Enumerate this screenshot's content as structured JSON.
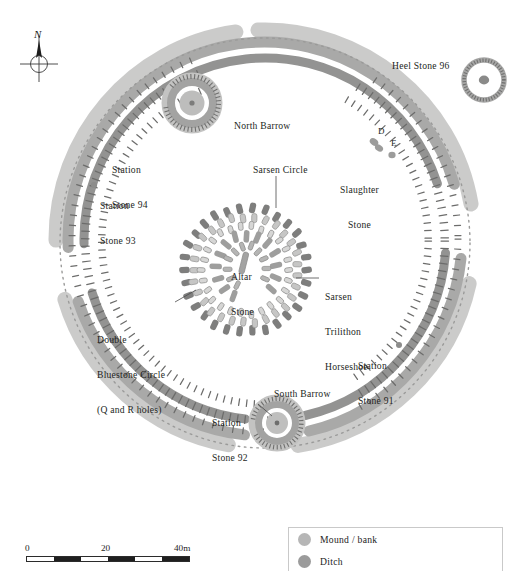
{
  "figure": {
    "kind": "archaeological-site-plan"
  },
  "compass": {
    "letter": "N",
    "icon": "north-arrow-icon"
  },
  "labels": [
    {
      "id": "north-barrow",
      "text": "North Barrow",
      "x": 234,
      "y": 120,
      "align": "left",
      "lines": [
        "North Barrow"
      ]
    },
    {
      "id": "heel-stone-96",
      "text": "Heel Stone 96",
      "x": 392,
      "y": 66,
      "align": "left",
      "lines": [
        "Heel Stone 96"
      ]
    },
    {
      "id": "station-stone-94",
      "text": "Station Stone 94",
      "x": 112,
      "y": 141,
      "align": "left",
      "lines": [
        "Station",
        "Stone 94"
      ]
    },
    {
      "id": "station-stone-93",
      "text": "Station Stone 93",
      "x": 92,
      "y": 177,
      "align": "left",
      "lines": [
        "Station",
        "Stone 93"
      ]
    },
    {
      "id": "sarsen-circle",
      "text": "Sarsen Circle",
      "x": 253,
      "y": 164,
      "align": "left",
      "lines": [
        "Sarsen Circle"
      ]
    },
    {
      "id": "slaughter-stone",
      "text": "Slaughter Stone",
      "x": 340,
      "y": 161,
      "align": "left",
      "lines": [
        "Slaughter",
        "Stone"
      ]
    },
    {
      "id": "stone-d",
      "text": "D",
      "x": 378,
      "y": 131,
      "align": "left",
      "lines": [
        "D"
      ]
    },
    {
      "id": "stone-e",
      "text": "E",
      "x": 391,
      "y": 142,
      "align": "left",
      "lines": [
        "E"
      ]
    },
    {
      "id": "altar-stone",
      "text": "Altar Stone",
      "x": 232,
      "y": 248,
      "align": "left",
      "lines": [
        "Altar",
        "Stone"
      ]
    },
    {
      "id": "sarsen-trilithon",
      "text": "Sarsen Trilithon Horseshoe",
      "x": 326,
      "y": 276,
      "align": "left",
      "lines": [
        "Sarsen",
        "Trilithon",
        "Horseshoe"
      ]
    },
    {
      "id": "double-bluestone",
      "text": "Double Bluestone Circle (Q and R holes)",
      "x": 97,
      "y": 311,
      "align": "left",
      "lines": [
        "Double",
        "Bluestone Circle",
        "(Q and R holes)"
      ]
    },
    {
      "id": "station-stone-91",
      "text": "Station Stone 91",
      "x": 358,
      "y": 339,
      "align": "left",
      "lines": [
        "Station",
        "Stone 91"
      ]
    },
    {
      "id": "south-barrow",
      "text": "South Barrow",
      "x": 274,
      "y": 392,
      "align": "left",
      "lines": [
        "South Barrow"
      ]
    },
    {
      "id": "station-stone-92",
      "text": "Station Stone 92",
      "x": 214,
      "y": 398,
      "align": "left",
      "lines": [
        "Station",
        "Stone 92"
      ]
    }
  ],
  "scalebar": {
    "ticks": [
      "0",
      "20",
      "40m"
    ],
    "unit": "m",
    "min": 0,
    "max": 40,
    "segments": [
      {
        "fill": "#ffffff"
      },
      {
        "fill": "#1f1f1f"
      },
      {
        "fill": "#ffffff"
      },
      {
        "fill": "#1f1f1f"
      },
      {
        "fill": "#ffffff"
      },
      {
        "fill": "#1f1f1f"
      }
    ]
  },
  "legend": {
    "items": [
      {
        "label": "Mound / bank",
        "color": "#b6b6b6"
      },
      {
        "label": "Ditch",
        "color": "#9b9b9b"
      }
    ]
  },
  "colors": {
    "mound_light": "#c0c0bf",
    "bank_mid": "#a7a7a6",
    "ditch_dark": "#8f8f8e",
    "stone_dark": "#7e7e7d",
    "stone_light": "#c6c6c5",
    "hachure": "#6f6f6e",
    "background": "#ffffff",
    "text": "#231f1c"
  }
}
